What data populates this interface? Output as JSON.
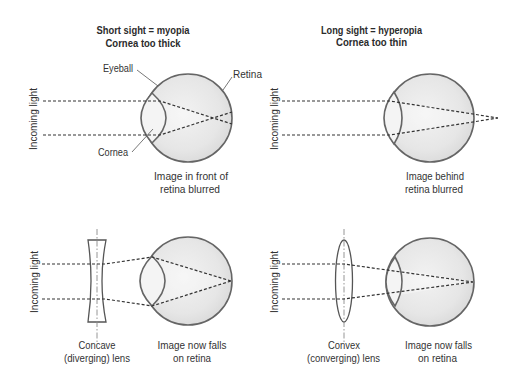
{
  "colors": {
    "background": "#ffffff",
    "eyeball_fill_center": "#f2f2f2",
    "eyeball_fill_edge": "#d9d9d9",
    "cornea_fill": "#f4f4f4",
    "outline": "#656565",
    "ray": "#333333",
    "text": "#333333"
  },
  "myopia": {
    "title": "Short sight = myopia",
    "subtitle": "Cornea too thick",
    "incoming_light": "Incoming light",
    "labels": {
      "eyeball": "Eyeball",
      "retina": "Retina",
      "cornea": "Cornea"
    },
    "caption": [
      "Image in front of",
      "retina blurred"
    ]
  },
  "hyperopia": {
    "title": "Long sight = hyperopia",
    "subtitle": "Cornea too thin",
    "incoming_light": "Incoming light",
    "caption": [
      "Image behind",
      "retina blurred"
    ]
  },
  "myopia_corrected": {
    "incoming_light": "Incoming light",
    "lens_label": [
      "Concave",
      "(diverging) lens"
    ],
    "caption": [
      "Image now falls",
      "on retina"
    ]
  },
  "hyperopia_corrected": {
    "incoming_light": "Incoming light",
    "lens_label": [
      "Convex",
      "(converging) lens"
    ],
    "caption": [
      "Image now falls",
      "on retina"
    ]
  }
}
